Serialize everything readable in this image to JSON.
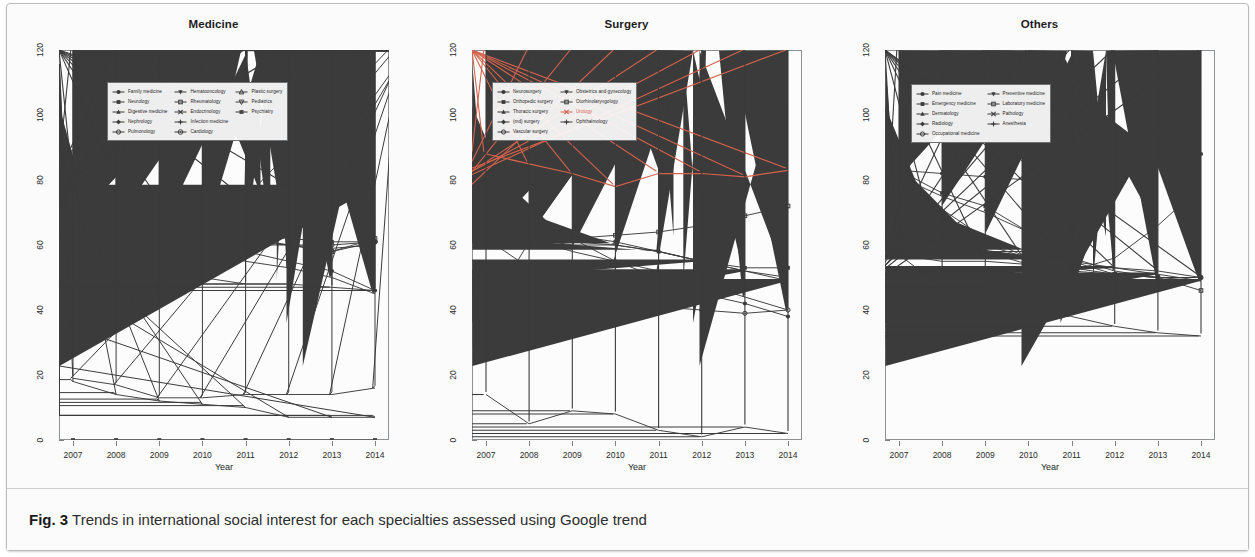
{
  "figure": {
    "label": "Fig. 3",
    "caption": "Trends in international social interest for each specialties assessed using Google trend",
    "axis_label_x": "Year",
    "yticks": [
      "0",
      "20",
      "40",
      "60",
      "80",
      "100",
      "120"
    ],
    "xticks": [
      "2007",
      "2008",
      "2009",
      "2010",
      "2011",
      "2012",
      "2013",
      "2014"
    ]
  },
  "chart_data": [
    {
      "type": "line",
      "title": "Medicine",
      "xlabel": "Year",
      "ylabel": "",
      "x": [
        2007,
        2008,
        2009,
        2010,
        2011,
        2012,
        2013,
        2014
      ],
      "ylim": [
        0,
        120
      ],
      "xlim": [
        2007,
        2014
      ],
      "grid": false,
      "legend_position": "top-left",
      "series": [
        {
          "name": "Family medicine",
          "values": [
            65,
            68,
            64,
            62,
            58,
            55,
            52,
            46
          ]
        },
        {
          "name": "Neurology",
          "values": [
            80,
            73,
            69,
            65,
            63,
            62,
            61,
            61
          ]
        },
        {
          "name": "Digestive medicine",
          "values": [
            79,
            70,
            66,
            64,
            62,
            60,
            59,
            60
          ]
        },
        {
          "name": "Nephrology",
          "values": [
            66,
            66,
            62,
            58,
            55,
            53,
            50,
            45
          ]
        },
        {
          "name": "Pulmonology",
          "values": [
            80,
            72,
            68,
            63,
            61,
            60,
            60,
            61
          ]
        },
        {
          "name": "Hematooncology",
          "values": [
            37,
            40,
            43,
            53,
            62,
            70,
            74,
            78
          ]
        },
        {
          "name": "Rheumatology",
          "values": [
            79,
            71,
            67,
            62,
            60,
            60,
            58,
            62
          ]
        },
        {
          "name": "Endocrinology",
          "values": [
            84,
            81,
            74,
            72,
            74,
            78,
            82,
            87
          ]
        },
        {
          "name": "Infection medicine",
          "values": [
            80,
            70,
            58,
            50,
            48,
            48,
            47,
            46
          ]
        },
        {
          "name": "Cardiology",
          "values": [
            79,
            72,
            74,
            72,
            62,
            60,
            58,
            61
          ]
        },
        {
          "name": "Plastic surgery",
          "values": [
            19,
            17,
            13,
            13,
            14,
            14,
            14,
            16
          ]
        },
        {
          "name": "Pediatrics",
          "values": [
            18,
            14,
            12,
            11,
            10,
            7,
            7,
            7
          ]
        },
        {
          "name": "Psychiatry",
          "values": [
            0,
            0,
            0,
            0,
            0,
            0,
            0,
            0
          ]
        }
      ]
    },
    {
      "type": "line",
      "title": "Surgery",
      "xlabel": "Year",
      "ylabel": "",
      "x": [
        2007,
        2008,
        2009,
        2010,
        2011,
        2012,
        2013,
        2014
      ],
      "ylim": [
        0,
        120
      ],
      "xlim": [
        2007,
        2014
      ],
      "grid": false,
      "legend_position": "top-left",
      "series": [
        {
          "name": "Neurosurgery",
          "values": [
            77,
            68,
            62,
            55,
            50,
            45,
            42,
            38
          ]
        },
        {
          "name": "Orthopedic surgery",
          "values": [
            71,
            66,
            63,
            61,
            58,
            55,
            53,
            53
          ]
        },
        {
          "name": "Thoracic surgery",
          "values": [
            62,
            62,
            58,
            55,
            52,
            48,
            44,
            40
          ]
        },
        {
          "name": "(md) surgery",
          "values": [
            62,
            62,
            61,
            60,
            58,
            55,
            52,
            50
          ]
        },
        {
          "name": "Vascular surgery",
          "values": [
            62,
            53,
            48,
            44,
            41,
            40,
            39,
            40
          ]
        },
        {
          "name": "Obstetrics and gynecology",
          "values": [
            63,
            62,
            60,
            60,
            58,
            55,
            52,
            49
          ]
        },
        {
          "name": "Otorhinolaryngology",
          "values": [
            39,
            61,
            62,
            63,
            64,
            66,
            69,
            72
          ]
        },
        {
          "name": "Urology",
          "values": [
            88,
            85,
            82,
            78,
            82,
            82,
            81,
            83
          ]
        },
        {
          "name": "Ophthalmology",
          "values": [
            14,
            5,
            9,
            8,
            3,
            1,
            4,
            2
          ]
        }
      ],
      "highlight_series": "Urology",
      "highlight_color": "#d4624a"
    },
    {
      "type": "line",
      "title": "Others",
      "xlabel": "Year",
      "ylabel": "",
      "x": [
        2007,
        2008,
        2009,
        2010,
        2011,
        2012,
        2013,
        2014
      ],
      "ylim": [
        0,
        120
      ],
      "xlim": [
        2007,
        2014
      ],
      "grid": false,
      "legend_position": "top-left",
      "series": [
        {
          "name": "Pain medicine",
          "values": [
            83,
            82,
            81,
            80,
            85,
            86,
            86,
            88
          ]
        },
        {
          "name": "Emergency medicine",
          "values": [
            83,
            76,
            72,
            64,
            55,
            51,
            50,
            50
          ]
        },
        {
          "name": "Dermatology",
          "values": [
            81,
            75,
            70,
            64,
            56,
            52,
            50,
            49
          ]
        },
        {
          "name": "Radiology",
          "values": [
            80,
            71,
            62,
            56,
            52,
            56,
            66,
            78
          ]
        },
        {
          "name": "Occupational medicine",
          "values": [
            69,
            65,
            60,
            56,
            53,
            51,
            50,
            50
          ]
        },
        {
          "name": "Preventive medicine",
          "values": [
            62,
            60,
            58,
            58,
            55,
            53,
            51,
            49
          ]
        },
        {
          "name": "Laboratory medicine",
          "values": [
            69,
            62,
            58,
            54,
            52,
            51,
            50,
            46
          ]
        },
        {
          "name": "Pathology",
          "values": [
            57,
            55,
            55,
            54,
            53,
            53,
            52,
            50
          ]
        },
        {
          "name": "Anesthesia",
          "values": [
            57,
            47,
            47,
            42,
            38,
            35,
            33,
            32
          ]
        }
      ]
    }
  ],
  "panels": [
    {
      "title": "Medicine",
      "legend_columns": [
        [
          "Family medicine",
          "Neurology",
          "Digestive medicine",
          "Nephrology",
          "Pulmonology"
        ],
        [
          "Hematooncology",
          "Rheumatology",
          "Endocrinology",
          "Infection medicine",
          "Cardiology"
        ],
        [
          "Plastic surgery",
          "Pediatrics",
          "Psychiatry"
        ]
      ]
    },
    {
      "title": "Surgery",
      "legend_columns": [
        [
          "Neurosurgery",
          "Orthopedic surgery",
          "Thoracic surgery",
          "(md) surgery",
          "Vascular surgery"
        ],
        [
          "Obstetrics and gynecology",
          "Otorhinolaryngology",
          "Urology",
          "Ophthalmology"
        ]
      ]
    },
    {
      "title": "Others",
      "legend_columns": [
        [
          "Pain medicine",
          "Emergency medicine",
          "Dermatology",
          "Radiology",
          "Occupational medicine"
        ],
        [
          "Preventive medicine",
          "Laboratory medicine",
          "Pathology",
          "Anesthesia"
        ]
      ]
    }
  ]
}
